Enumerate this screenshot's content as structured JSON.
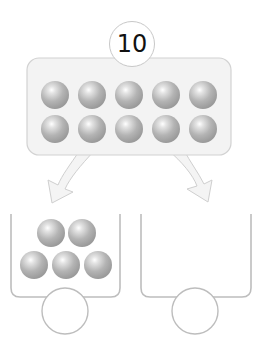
{
  "total": {
    "value": "10"
  },
  "tray": {
    "ball_count": 10,
    "rows": 2,
    "cols": 5
  },
  "containers": [
    {
      "ball_count": 5,
      "answer": ""
    },
    {
      "ball_count": 0,
      "answer": ""
    }
  ],
  "colors": {
    "ball": "#b0b0b0",
    "tray_fill": "#f3f3f3",
    "outline": "#c4c4c4",
    "arrow_fill": "#f4f4f4"
  }
}
